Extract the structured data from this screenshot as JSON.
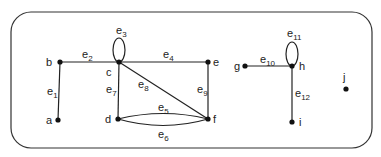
{
  "graph": {
    "vertices": [
      {
        "id": "a",
        "label": "a",
        "x": 58,
        "y": 120,
        "lx": 46,
        "ly": 124
      },
      {
        "id": "b",
        "label": "b",
        "x": 60,
        "y": 62,
        "lx": 46,
        "ly": 66
      },
      {
        "id": "c",
        "label": "c",
        "x": 119,
        "y": 62,
        "lx": 106,
        "ly": 76
      },
      {
        "id": "d",
        "label": "d",
        "x": 118,
        "y": 119,
        "lx": 105,
        "ly": 123
      },
      {
        "id": "e",
        "label": "e",
        "x": 208,
        "y": 62,
        "lx": 213,
        "ly": 66
      },
      {
        "id": "f",
        "label": "f",
        "x": 208,
        "y": 119,
        "lx": 213,
        "ly": 123
      },
      {
        "id": "g",
        "label": "g",
        "x": 245,
        "y": 66,
        "lx": 234,
        "ly": 70
      },
      {
        "id": "h",
        "label": "h",
        "x": 292,
        "y": 66,
        "lx": 299,
        "ly": 70
      },
      {
        "id": "i",
        "label": "i",
        "x": 292,
        "y": 122,
        "lx": 299,
        "ly": 126
      },
      {
        "id": "j",
        "label": "j",
        "x": 346,
        "y": 89,
        "lx": 343,
        "ly": 81
      }
    ],
    "edges": [
      {
        "label": "e",
        "sub": "1",
        "lx": 47,
        "ly": 95
      },
      {
        "label": "e",
        "sub": "2",
        "lx": 82,
        "ly": 58
      },
      {
        "label": "e",
        "sub": "3",
        "lx": 116,
        "ly": 34
      },
      {
        "label": "e",
        "sub": "4",
        "lx": 163,
        "ly": 58
      },
      {
        "label": "e",
        "sub": "5",
        "lx": 158,
        "ly": 111
      },
      {
        "label": "e",
        "sub": "6",
        "lx": 158,
        "ly": 138
      },
      {
        "label": "e",
        "sub": "7",
        "lx": 106,
        "ly": 93
      },
      {
        "label": "e",
        "sub": "8",
        "lx": 138,
        "ly": 88
      },
      {
        "label": "e",
        "sub": "9",
        "lx": 197,
        "ly": 93
      },
      {
        "label": "e",
        "sub": "10",
        "lx": 260,
        "ly": 63
      },
      {
        "label": "e",
        "sub": "11",
        "lx": 287,
        "ly": 37
      },
      {
        "label": "e",
        "sub": "12",
        "lx": 295,
        "ly": 97
      }
    ]
  }
}
